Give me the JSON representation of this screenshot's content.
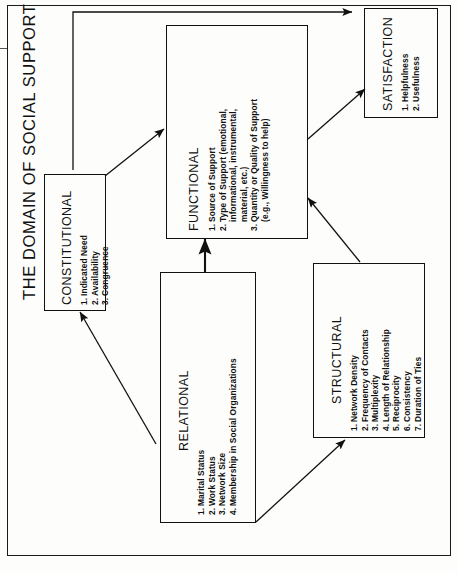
{
  "title": "THE DOMAIN OF SOCIAL SUPPORT",
  "colors": {
    "ink": "#111111",
    "paper": "#fdfdfb"
  },
  "boxes": {
    "constitutional": {
      "heading": "CONSTITUTIONAL",
      "items": [
        {
          "num": "1.",
          "text": "Indicated Need"
        },
        {
          "num": "2.",
          "text": "Availability"
        },
        {
          "num": "3.",
          "text": "Congruence"
        }
      ]
    },
    "functional": {
      "heading": "FUNCTIONAL",
      "items": [
        {
          "num": "1.",
          "text": "Source of Support"
        },
        {
          "num": "2.",
          "text": "Type of Support (emotional,"
        },
        {
          "num": "",
          "text": "informational, instrumental,"
        },
        {
          "num": "",
          "text": "material, etc.)"
        },
        {
          "num": "3.",
          "text": "Quantity or Quality of Support"
        },
        {
          "num": "",
          "text": "(e.g., Willingness to help)"
        }
      ]
    },
    "relational": {
      "heading": "RELATIONAL",
      "items": [
        {
          "num": "1.",
          "text": "Marital Status"
        },
        {
          "num": "2.",
          "text": "Work Status"
        },
        {
          "num": "3.",
          "text": "Network Size"
        },
        {
          "num": "4.",
          "text": "Membership in Social Organizations"
        }
      ]
    },
    "structural": {
      "heading": "STRUCTURAL",
      "items": [
        {
          "num": "1.",
          "text": "Network Density"
        },
        {
          "num": "2.",
          "text": "Frequency of Contacts"
        },
        {
          "num": "3.",
          "text": "Multiplexity"
        },
        {
          "num": "4.",
          "text": "Length of Relationship"
        },
        {
          "num": "5.",
          "text": "Reciprocity"
        },
        {
          "num": "6.",
          "text": "Consistency"
        },
        {
          "num": "7.",
          "text": "Duration of Ties"
        }
      ]
    },
    "satisfaction": {
      "heading": "SATISFACTION",
      "items": [
        {
          "num": "1.",
          "text": "Helpfulness"
        },
        {
          "num": "2.",
          "text": "Usefulness"
        }
      ]
    }
  },
  "arrows": [
    {
      "name": "constitutional-to-satisfaction",
      "from": "CONSTITUTIONAL",
      "to": "SATISFACTION"
    },
    {
      "name": "constitutional-to-functional",
      "from": "CONSTITUTIONAL",
      "to": "FUNCTIONAL"
    },
    {
      "name": "relational-to-constitutional",
      "from": "RELATIONAL",
      "to": "CONSTITUTIONAL"
    },
    {
      "name": "relational-to-functional",
      "from": "RELATIONAL",
      "to": "FUNCTIONAL"
    },
    {
      "name": "relational-to-structural",
      "from": "RELATIONAL",
      "to": "STRUCTURAL"
    },
    {
      "name": "structural-to-functional",
      "from": "STRUCTURAL",
      "to": "FUNCTIONAL"
    },
    {
      "name": "functional-to-satisfaction",
      "from": "FUNCTIONAL",
      "to": "SATISFACTION"
    }
  ]
}
